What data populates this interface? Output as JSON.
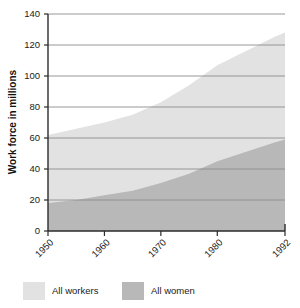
{
  "chart_data": {
    "type": "area",
    "stacked": true,
    "title": "",
    "subtitle": "",
    "xlabel": "",
    "ylabel": "Work force in millions",
    "ylim": [
      0,
      140
    ],
    "xlim": [
      1950,
      1992
    ],
    "yticks": [
      0,
      20,
      40,
      60,
      80,
      100,
      120,
      140
    ],
    "ytick_labels": [
      "0",
      "20",
      "40",
      "60",
      "80",
      "100",
      "120",
      "140"
    ],
    "xticks": [
      1950,
      1960,
      1970,
      1980,
      1992
    ],
    "xtick_labels": [
      "1950",
      "1960",
      "1970",
      "1980",
      "1992"
    ],
    "grid": true,
    "grid_axis": "y",
    "legend_position": "bottom-left",
    "x": [
      1950,
      1955,
      1960,
      1965,
      1970,
      1975,
      1980,
      1985,
      1990,
      1992
    ],
    "series": [
      {
        "name": "All workers",
        "color": "#e2e2e2",
        "values": [
          62,
          66,
          70,
          75,
          83,
          94,
          107,
          116,
          125,
          128
        ]
      },
      {
        "name": "All women",
        "color": "#b8b8b8",
        "values": [
          18,
          20,
          23,
          26,
          31,
          37,
          45,
          51,
          57,
          59
        ]
      }
    ]
  },
  "legend": {
    "items": [
      {
        "label": "All workers",
        "color": "#e2e2e2"
      },
      {
        "label": "All women",
        "color": "#b8b8b8"
      }
    ]
  },
  "axes": {
    "y_title": "Work force in millions"
  },
  "colors": {
    "all_workers": "#e2e2e2",
    "all_women": "#b8b8b8",
    "gridline": "#8d8d8d",
    "axis": "#2b2b2b",
    "text": "#1a1a1a"
  }
}
